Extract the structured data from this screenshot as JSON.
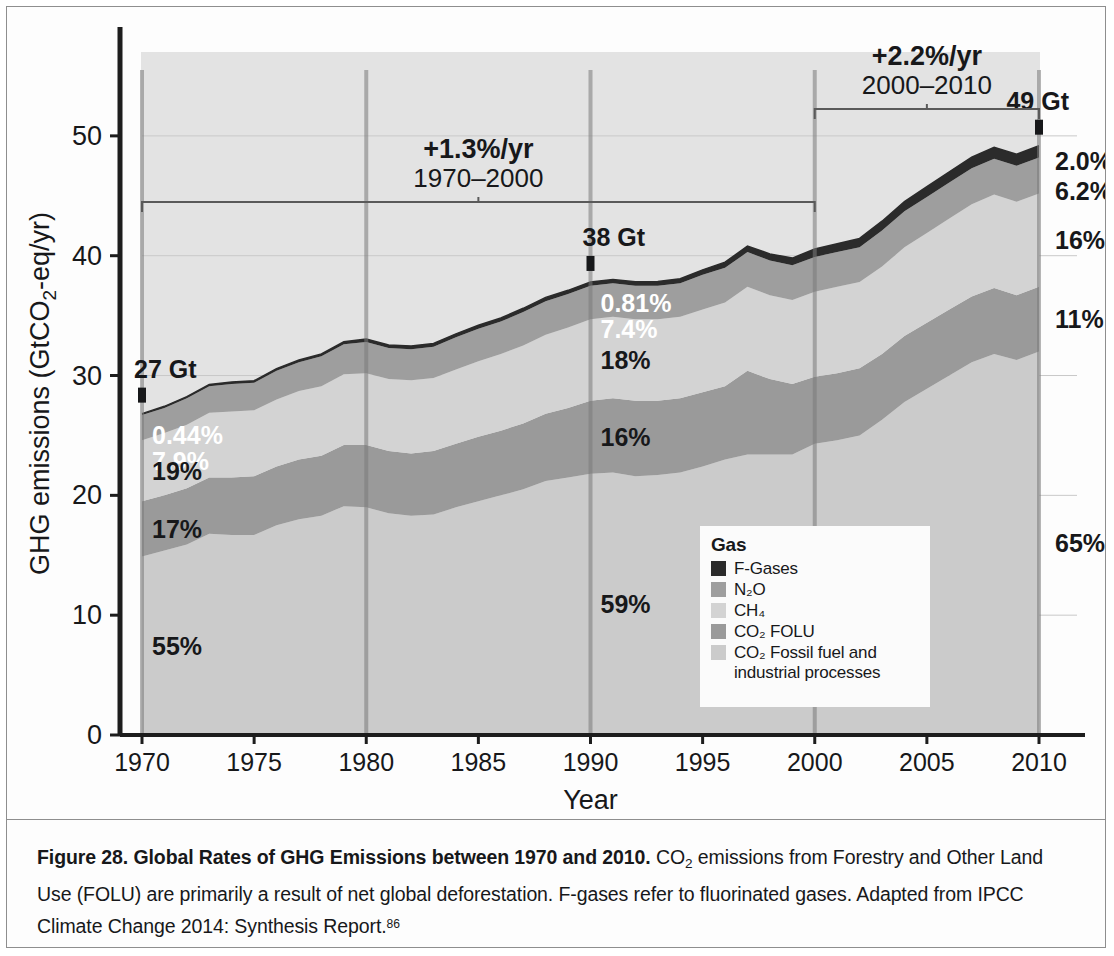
{
  "figure": {
    "caption_number": "Figure 28.",
    "caption_title": "Global Rates of GHG Emissions between 1970 and 2010.",
    "caption_body_1": "CO",
    "caption_body_sub": "2",
    "caption_body_2": " emissions from Forestry and Other Land Use (FOLU) are primarily a result of net global deforestation. F-gases refer to fluorinated gases. Adapted from IPCC Climate Change 2014: Synthesis Report.",
    "caption_footnote": "86"
  },
  "legend": {
    "title": "Gas",
    "items": [
      {
        "label": "F-Gases",
        "color": "#2b2b2b",
        "wrap": false
      },
      {
        "label": "N₂O",
        "color": "#9e9e9e",
        "wrap": false
      },
      {
        "label": "CH₄",
        "color": "#d3d3d3",
        "wrap": false
      },
      {
        "label": "CO₂ FOLU",
        "color": "#9a9a9a",
        "wrap": false
      },
      {
        "label": "CO₂ Fossil fuel and industrial processes",
        "color": "#cbcbcb",
        "wrap": true
      }
    ]
  },
  "chart_data": {
    "type": "area",
    "stacked": true,
    "title": "",
    "xlabel": "Year",
    "ylabel": "GHG emissions (GtCO₂-eq/yr)",
    "xlim": [
      1970,
      2010
    ],
    "ylim": [
      0,
      57
    ],
    "yticks": [
      0,
      10,
      20,
      30,
      40,
      50
    ],
    "xticks": [
      1970,
      1975,
      1980,
      1985,
      1990,
      1995,
      2000,
      2005,
      2010
    ],
    "grid": "horizontal-light",
    "legend_position": "inside-bottom-right",
    "x": [
      1970,
      1971,
      1972,
      1973,
      1974,
      1975,
      1976,
      1977,
      1978,
      1979,
      1980,
      1981,
      1982,
      1983,
      1984,
      1985,
      1986,
      1987,
      1988,
      1989,
      1990,
      1991,
      1992,
      1993,
      1994,
      1995,
      1996,
      1997,
      1998,
      1999,
      2000,
      2001,
      2002,
      2003,
      2004,
      2005,
      2006,
      2007,
      2008,
      2009,
      2010
    ],
    "series": [
      {
        "name": "CO2 Fossil fuel and industrial processes",
        "color": "#cbcbcb",
        "values": [
          14.9,
          15.4,
          15.9,
          16.8,
          16.7,
          16.7,
          17.5,
          18.0,
          18.3,
          19.1,
          19.0,
          18.5,
          18.3,
          18.4,
          19.0,
          19.5,
          20.0,
          20.5,
          21.2,
          21.5,
          21.8,
          21.9,
          21.6,
          21.7,
          21.9,
          22.4,
          23.0,
          23.4,
          23.4,
          23.4,
          24.3,
          24.6,
          25.0,
          26.3,
          27.8,
          28.9,
          30.0,
          31.1,
          31.8,
          31.3,
          32.0
        ]
      },
      {
        "name": "CO2 FOLU",
        "color": "#9a9a9a",
        "values": [
          4.6,
          4.6,
          4.7,
          4.7,
          4.8,
          4.9,
          4.9,
          5.0,
          5.0,
          5.1,
          5.2,
          5.2,
          5.2,
          5.3,
          5.3,
          5.4,
          5.4,
          5.5,
          5.6,
          5.8,
          6.1,
          6.2,
          6.3,
          6.2,
          6.2,
          6.2,
          6.1,
          7.0,
          6.3,
          5.9,
          5.6,
          5.6,
          5.6,
          5.5,
          5.5,
          5.5,
          5.5,
          5.5,
          5.5,
          5.4,
          5.4
        ]
      },
      {
        "name": "CH4",
        "color": "#d3d3d3",
        "values": [
          5.1,
          5.2,
          5.3,
          5.4,
          5.5,
          5.5,
          5.6,
          5.7,
          5.8,
          5.9,
          6.0,
          6.0,
          6.1,
          6.1,
          6.2,
          6.3,
          6.4,
          6.5,
          6.6,
          6.7,
          6.8,
          6.8,
          6.8,
          6.8,
          6.8,
          6.9,
          7.0,
          7.0,
          7.0,
          7.0,
          7.1,
          7.2,
          7.2,
          7.3,
          7.4,
          7.5,
          7.6,
          7.7,
          7.8,
          7.8,
          7.8
        ]
      },
      {
        "name": "N2O",
        "color": "#9e9e9e",
        "values": [
          2.1,
          2.1,
          2.2,
          2.2,
          2.3,
          2.3,
          2.4,
          2.4,
          2.5,
          2.5,
          2.6,
          2.6,
          2.6,
          2.6,
          2.7,
          2.7,
          2.7,
          2.8,
          2.8,
          2.8,
          2.8,
          2.8,
          2.8,
          2.8,
          2.8,
          2.9,
          2.9,
          2.9,
          2.9,
          2.9,
          2.9,
          2.9,
          2.9,
          3.0,
          3.0,
          3.0,
          3.0,
          3.0,
          3.0,
          3.0,
          3.0
        ]
      },
      {
        "name": "F-Gases",
        "color": "#2b2b2b",
        "values": [
          0.12,
          0.13,
          0.14,
          0.15,
          0.16,
          0.17,
          0.18,
          0.19,
          0.2,
          0.22,
          0.24,
          0.25,
          0.26,
          0.27,
          0.28,
          0.29,
          0.3,
          0.31,
          0.32,
          0.31,
          0.31,
          0.32,
          0.33,
          0.35,
          0.38,
          0.42,
          0.46,
          0.5,
          0.55,
          0.6,
          0.66,
          0.7,
          0.74,
          0.78,
          0.82,
          0.86,
          0.9,
          0.92,
          0.95,
          0.97,
          0.98
        ]
      }
    ],
    "marker_years": [
      1970,
      1980,
      1990,
      2000,
      2010
    ],
    "totals_annotations": [
      {
        "year": 1970,
        "label": "27 Gt"
      },
      {
        "year": 1990,
        "label": "38 Gt"
      },
      {
        "year": 2010,
        "label": "49 Gt"
      }
    ],
    "share_annotations": [
      {
        "year": 1970,
        "values": [
          "0.44%",
          "7.9%",
          "19%",
          "17%",
          "55%"
        ]
      },
      {
        "year": 1990,
        "values": [
          "0.81%",
          "7.4%",
          "18%",
          "16%",
          "59%"
        ]
      },
      {
        "year": 2010,
        "values": [
          "2.0%",
          "6.2%",
          "16%",
          "11%",
          "65%"
        ]
      }
    ],
    "growth_annotations": [
      {
        "rate": "+1.3%/yr",
        "period": "1970–2000",
        "from": 1970,
        "to": 2000
      },
      {
        "rate": "+2.2%/yr",
        "period": "2000–2010",
        "from": 2000,
        "to": 2010
      }
    ]
  },
  "axis_labels": {
    "y_prefix": "GHG emissions (GtCO",
    "y_sub": "2",
    "y_suffix": "-eq/yr)",
    "x_title": "Year"
  }
}
